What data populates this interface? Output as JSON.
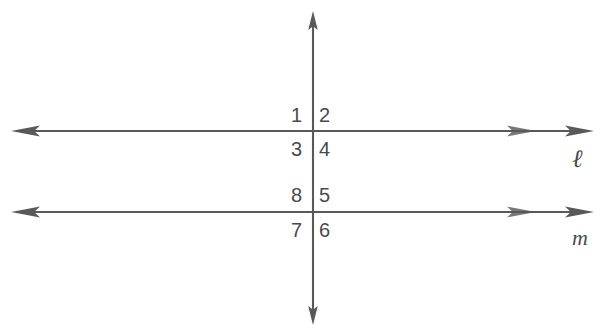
{
  "diagram": {
    "type": "geometry-diagram",
    "background_color": "#ffffff",
    "stroke_color": "#595959",
    "text_color": "#4a4a4a",
    "canvas": {
      "width": 603,
      "height": 334
    }
  },
  "lines": [
    {
      "id": "line-l",
      "label": "ℓ",
      "orientation": "horizontal",
      "y": 131,
      "x_start": 12,
      "x_end": 592,
      "arrows": "both",
      "label_x": 572,
      "label_y": 146
    },
    {
      "id": "line-m",
      "label": "m",
      "orientation": "horizontal",
      "y": 212,
      "x_start": 12,
      "x_end": 592,
      "arrows": "both",
      "label_x": 572,
      "label_y": 227
    },
    {
      "id": "transversal",
      "label": "",
      "orientation": "vertical",
      "x": 313,
      "y_start": 12,
      "y_end": 324,
      "arrows": "both",
      "label_x": 0,
      "label_y": 0
    }
  ],
  "intersections": [
    {
      "id": "intersection-upper",
      "x": 313,
      "y": 131,
      "lines": "transversal × ℓ"
    },
    {
      "id": "intersection-lower",
      "x": 313,
      "y": 212,
      "lines": "transversal × m"
    }
  ],
  "angles": [
    {
      "number": "1",
      "x": 291,
      "y": 105,
      "position": "upper-left",
      "intersection": "intersection-upper"
    },
    {
      "number": "2",
      "x": 319,
      "y": 105,
      "position": "upper-right",
      "intersection": "intersection-upper"
    },
    {
      "number": "3",
      "x": 291,
      "y": 139,
      "position": "lower-left",
      "intersection": "intersection-upper"
    },
    {
      "number": "4",
      "x": 319,
      "y": 139,
      "position": "lower-right",
      "intersection": "intersection-upper"
    },
    {
      "number": "8",
      "x": 291,
      "y": 185,
      "position": "upper-left",
      "intersection": "intersection-lower"
    },
    {
      "number": "5",
      "x": 319,
      "y": 185,
      "position": "upper-right",
      "intersection": "intersection-lower"
    },
    {
      "number": "7",
      "x": 291,
      "y": 220,
      "position": "lower-left",
      "intersection": "intersection-lower"
    },
    {
      "number": "6",
      "x": 319,
      "y": 220,
      "position": "lower-right",
      "intersection": "intersection-lower"
    }
  ]
}
